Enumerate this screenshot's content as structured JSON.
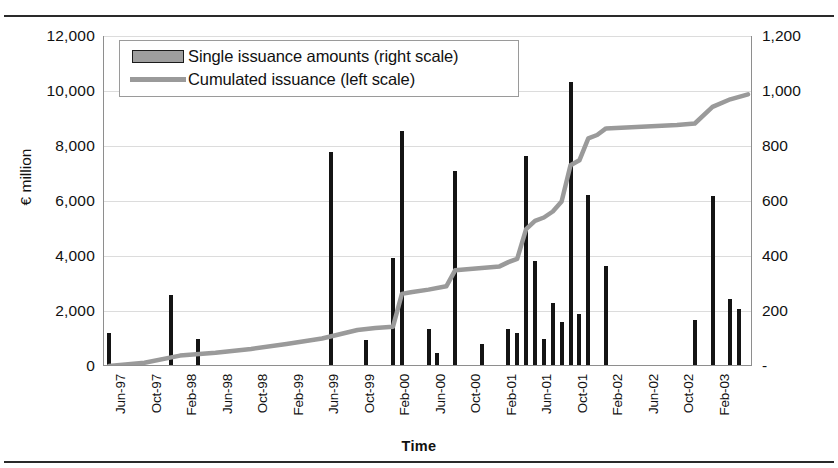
{
  "figure": {
    "xlabel": "Time",
    "ylabel_left": "€ million",
    "legend": {
      "bars_label": "Single issuance amounts (right scale)",
      "line_label": "Cumulated issuance (left scale)",
      "position": "top-left"
    },
    "colors": {
      "bar": "#141414",
      "line": "#9a9a9a",
      "grid": "#dcdcdc",
      "axis": "#8e8e8e"
    }
  },
  "chart_data": {
    "type": "bar",
    "title": "",
    "subtitle": "",
    "xlabel": "Time",
    "ylabel": "€ million",
    "grid": true,
    "legend_position": "top-left",
    "ylim_left": [
      0,
      12000
    ],
    "ytick_left": [
      "0",
      "2,000",
      "4,000",
      "6,000",
      "8,000",
      "10,000",
      "12,000"
    ],
    "ylim_right": [
      0,
      1200
    ],
    "ytick_right": [
      "-",
      "200",
      "400",
      "600",
      "800",
      "1,000",
      "1,200"
    ],
    "xtick_labels": [
      "Jun-97",
      "Oct-97",
      "Feb-98",
      "Jun-98",
      "Oct-98",
      "Feb-99",
      "Jun-99",
      "Oct-99",
      "Feb-00",
      "Jun-00",
      "Oct-00",
      "Feb-01",
      "Jun-01",
      "Oct-01",
      "Feb-02",
      "Jun-02",
      "Oct-02",
      "Feb-03"
    ],
    "xtick_step_months": 4,
    "x_start": "Jun-97",
    "x_end": "Jun-03",
    "series": [
      {
        "name": "Single issuance amounts (right scale)",
        "type": "bar",
        "axis": "right",
        "units": "€ million",
        "points": [
          {
            "x": "Jun-97",
            "v": 115
          },
          {
            "x": "Jan-98",
            "v": 255
          },
          {
            "x": "Apr-98",
            "v": 95
          },
          {
            "x": "Jul-99",
            "v": 775
          },
          {
            "x": "Nov-99",
            "v": 90
          },
          {
            "x": "Feb-00",
            "v": 390
          },
          {
            "x": "Mar-00",
            "v": 850
          },
          {
            "x": "Jun-00",
            "v": 130
          },
          {
            "x": "Jul-00",
            "v": 45
          },
          {
            "x": "Sep-00",
            "v": 705
          },
          {
            "x": "Dec-00",
            "v": 75
          },
          {
            "x": "Mar-01",
            "v": 130
          },
          {
            "x": "Apr-01",
            "v": 115
          },
          {
            "x": "May-01",
            "v": 760
          },
          {
            "x": "Jun-01",
            "v": 380
          },
          {
            "x": "Jul-01",
            "v": 95
          },
          {
            "x": "Aug-01",
            "v": 225
          },
          {
            "x": "Sep-01",
            "v": 155
          },
          {
            "x": "Oct-01",
            "v": 1030
          },
          {
            "x": "Nov-01",
            "v": 185
          },
          {
            "x": "Dec-01",
            "v": 620
          },
          {
            "x": "Feb-02",
            "v": 360
          },
          {
            "x": "Dec-02",
            "v": 165
          },
          {
            "x": "Feb-03",
            "v": 615
          },
          {
            "x": "Apr-03",
            "v": 240
          },
          {
            "x": "May-03",
            "v": 205
          }
        ]
      },
      {
        "name": "Cumulated issuance (left scale)",
        "type": "line",
        "axis": "left",
        "units": "€ million",
        "points": [
          {
            "x": "Jun-97",
            "v": 0
          },
          {
            "x": "Oct-97",
            "v": 120
          },
          {
            "x": "Feb-98",
            "v": 380
          },
          {
            "x": "Jun-98",
            "v": 480
          },
          {
            "x": "Oct-98",
            "v": 620
          },
          {
            "x": "Feb-99",
            "v": 800
          },
          {
            "x": "Jun-99",
            "v": 1000
          },
          {
            "x": "Oct-99",
            "v": 1310
          },
          {
            "x": "Dec-99",
            "v": 1380
          },
          {
            "x": "Feb-00",
            "v": 1430
          },
          {
            "x": "Mar-00",
            "v": 2620
          },
          {
            "x": "Apr-00",
            "v": 2680
          },
          {
            "x": "Jun-00",
            "v": 2780
          },
          {
            "x": "Aug-00",
            "v": 2900
          },
          {
            "x": "Sep-00",
            "v": 3480
          },
          {
            "x": "Oct-00",
            "v": 3510
          },
          {
            "x": "Feb-01",
            "v": 3620
          },
          {
            "x": "Mar-01",
            "v": 3780
          },
          {
            "x": "Apr-01",
            "v": 3900
          },
          {
            "x": "May-01",
            "v": 4980
          },
          {
            "x": "Jun-01",
            "v": 5280
          },
          {
            "x": "Jul-01",
            "v": 5400
          },
          {
            "x": "Aug-01",
            "v": 5620
          },
          {
            "x": "Sep-01",
            "v": 5980
          },
          {
            "x": "Oct-01",
            "v": 7300
          },
          {
            "x": "Nov-01",
            "v": 7480
          },
          {
            "x": "Dec-01",
            "v": 8280
          },
          {
            "x": "Jan-02",
            "v": 8400
          },
          {
            "x": "Feb-02",
            "v": 8640
          },
          {
            "x": "Jun-02",
            "v": 8700
          },
          {
            "x": "Oct-02",
            "v": 8760
          },
          {
            "x": "Dec-02",
            "v": 8820
          },
          {
            "x": "Feb-03",
            "v": 9420
          },
          {
            "x": "Apr-03",
            "v": 9700
          },
          {
            "x": "Jun-03",
            "v": 9880
          }
        ]
      }
    ]
  }
}
